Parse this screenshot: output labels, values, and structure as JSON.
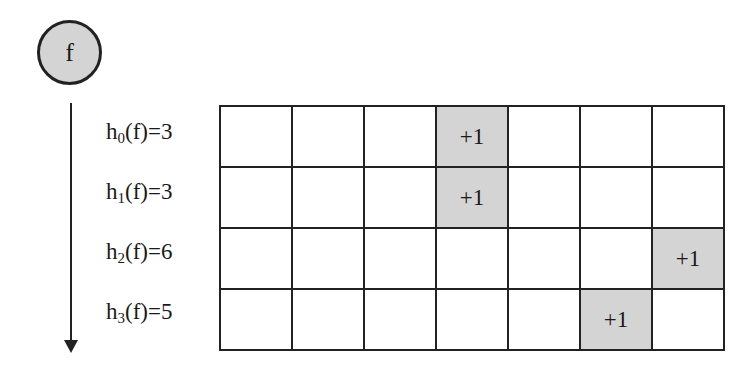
{
  "node": {
    "label": "f"
  },
  "hash_functions": [
    {
      "name": "h",
      "index": "0",
      "arg": "(f)=",
      "value": 3,
      "label_suffix": "3"
    },
    {
      "name": "h",
      "index": "1",
      "arg": "(f)=",
      "value": 3,
      "label_suffix": "3"
    },
    {
      "name": "h",
      "index": "2",
      "arg": "(f)=",
      "value": 6,
      "label_suffix": "6"
    },
    {
      "name": "h",
      "index": "3",
      "arg": "(f)=",
      "value": 5,
      "label_suffix": "5"
    }
  ],
  "grid": {
    "rows": 4,
    "columns": 7,
    "increment_label": "+1",
    "highlight_color": "#d4d4d4"
  }
}
